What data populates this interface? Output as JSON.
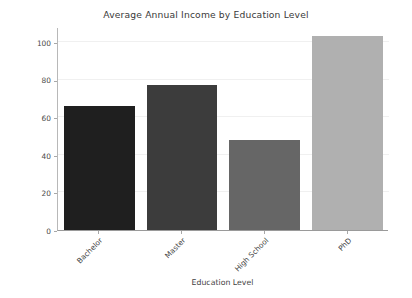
{
  "chart_data": {
    "type": "bar",
    "title": "Average Annual Income by Education Level",
    "xlabel": "Education Level",
    "ylabel": "Average Annual Income",
    "categories": [
      "Bachelor",
      "Master",
      "High School",
      "PhD"
    ],
    "values": [
      66,
      77,
      48,
      103
    ],
    "bar_colors": [
      "#1f1f1f",
      "#3c3c3c",
      "#666666",
      "#b0b0b0"
    ],
    "ylim": [
      0,
      108
    ],
    "yticks": [
      0,
      20,
      40,
      60,
      80,
      100
    ],
    "ytick_labels": [
      "0",
      "20",
      "40",
      "60",
      "80",
      "100"
    ],
    "grid": "horizontal",
    "legend": "none",
    "xtick_rotation": -45
  }
}
